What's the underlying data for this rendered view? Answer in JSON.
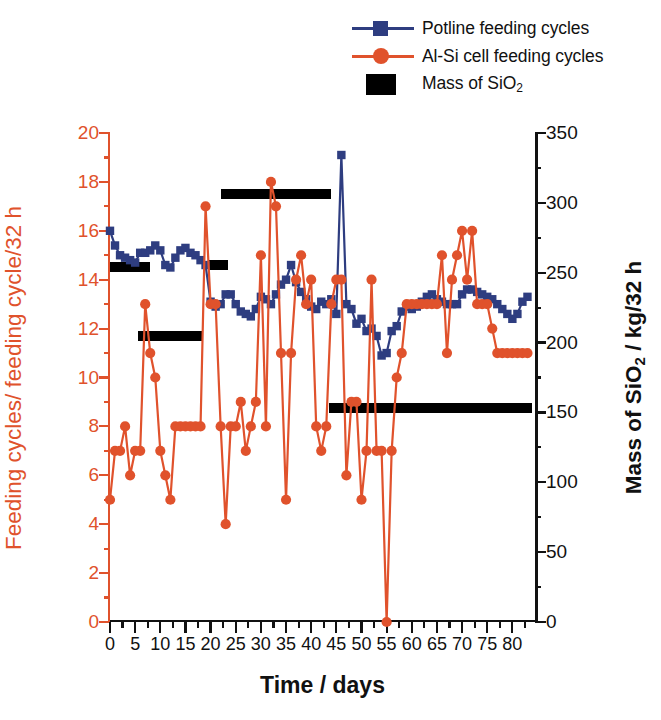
{
  "legend": {
    "items": [
      {
        "label": "Potline feeding cycles",
        "marker": "square-marker-icon",
        "color": "#2e3d80"
      },
      {
        "label": "Al-Si cell feeding cycles",
        "marker": "circle-marker-icon",
        "color": "#e0522c"
      },
      {
        "label": "Mass of SiO",
        "sub": "2",
        "label_suffix": "",
        "marker": "black-bar-icon",
        "color": "#000000"
      }
    ],
    "mass_label_prefix": "Mass of SiO"
  },
  "chart_data": {
    "type": "line",
    "title": "",
    "xlabel": "Time / days",
    "ylabel_left": "Feeding cycles/ feeding cycle/32 h",
    "ylabel_right_prefix": "Mass of SiO",
    "ylabel_right_sub": "2",
    "ylabel_right_suffix": " / kg/32 h",
    "xlim": [
      0,
      84.5
    ],
    "ylim_left": [
      0,
      20
    ],
    "ylim_right": [
      0,
      350
    ],
    "xticks": [
      0,
      5,
      10,
      15,
      20,
      25,
      30,
      35,
      40,
      45,
      50,
      55,
      60,
      65,
      70,
      75,
      80
    ],
    "xminor_step": 2.5,
    "yticks_left": [
      0,
      2,
      4,
      6,
      8,
      10,
      12,
      14,
      16,
      18,
      20
    ],
    "yminor_left_step": 1,
    "yticks_right": [
      0,
      50,
      100,
      150,
      200,
      250,
      300,
      350
    ],
    "yminor_right_step": 25,
    "grid": false,
    "legend_position": "top-right",
    "series": [
      {
        "name": "Potline feeding cycles",
        "axis": "left",
        "color": "#2e3d80",
        "marker": "square",
        "x": [
          0,
          1,
          2,
          3,
          4,
          5,
          6,
          7,
          8,
          9,
          10,
          11,
          12,
          13,
          14,
          15,
          16,
          17,
          18,
          19,
          20,
          21,
          22,
          23,
          24,
          25,
          26,
          27,
          28,
          29,
          30,
          31,
          32,
          33,
          34,
          35,
          36,
          37,
          38,
          39,
          40,
          41,
          42,
          43,
          44,
          45,
          46,
          47,
          48,
          49,
          50,
          51,
          52,
          53,
          54,
          55,
          56,
          57,
          58,
          59,
          60,
          61,
          62,
          63,
          64,
          65,
          66,
          67,
          68,
          69,
          70,
          71,
          72,
          73,
          74,
          75,
          76,
          77,
          78,
          79,
          80,
          81,
          82,
          83
        ],
        "y": [
          16.0,
          15.4,
          15.0,
          14.9,
          14.8,
          14.7,
          15.1,
          15.1,
          15.2,
          15.4,
          15.2,
          14.6,
          14.5,
          14.9,
          15.2,
          15.3,
          15.1,
          15.0,
          14.8,
          14.6,
          13.1,
          12.9,
          13.0,
          13.4,
          13.4,
          13.0,
          12.7,
          12.6,
          12.5,
          12.8,
          13.3,
          13.2,
          13.0,
          13.4,
          13.8,
          14.0,
          14.6,
          13.9,
          13.5,
          13.2,
          12.9,
          12.8,
          13.1,
          13.0,
          13.2,
          12.6,
          19.1,
          13.0,
          12.8,
          12.2,
          12.4,
          11.9,
          12.0,
          11.7,
          10.9,
          11.0,
          11.9,
          12.1,
          12.7,
          12.9,
          12.8,
          12.9,
          13.1,
          13.3,
          13.4,
          13.2,
          13.1,
          13.0,
          13.0,
          13.0,
          13.4,
          13.6,
          13.6,
          13.5,
          13.4,
          13.3,
          13.2,
          13.0,
          12.8,
          12.6,
          12.4,
          12.6,
          13.1,
          13.3
        ]
      },
      {
        "name": "Al-Si cell feeding cycles",
        "axis": "left",
        "color": "#e0522c",
        "marker": "circle",
        "x": [
          0,
          1,
          2,
          3,
          4,
          5,
          6,
          7,
          8,
          9,
          10,
          11,
          12,
          13,
          14,
          15,
          16,
          17,
          18,
          19,
          20,
          21,
          22,
          23,
          24,
          25,
          26,
          27,
          28,
          29,
          30,
          31,
          32,
          33,
          34,
          35,
          36,
          37,
          38,
          39,
          40,
          41,
          42,
          43,
          44,
          45,
          46,
          47,
          48,
          49,
          50,
          51,
          52,
          53,
          54,
          55,
          56,
          57,
          58,
          59,
          60,
          61,
          62,
          63,
          64,
          65,
          66,
          67,
          68,
          69,
          70,
          71,
          72,
          73,
          74,
          75,
          76,
          77,
          78,
          79,
          80,
          81,
          82,
          83
        ],
        "y": [
          5,
          7,
          7,
          8,
          6,
          7,
          7,
          13,
          11,
          10,
          7,
          6,
          5,
          8,
          8,
          8,
          8,
          8,
          8,
          17,
          13,
          13,
          8,
          4,
          8,
          8,
          9,
          7,
          8,
          9,
          15,
          8,
          18,
          17,
          11,
          5,
          11,
          14,
          15,
          13,
          14,
          8,
          7,
          8,
          13,
          14,
          14,
          6,
          9,
          9,
          5,
          7,
          14,
          7,
          7,
          0,
          7,
          10,
          11,
          13,
          13,
          13,
          13,
          13,
          13,
          13,
          15,
          11,
          14,
          15,
          16,
          14,
          16,
          13,
          13,
          13,
          12,
          11,
          11,
          11,
          11,
          11,
          11,
          11
        ]
      }
    ],
    "bars": [
      {
        "name": "bar-1",
        "x_start": 0.0,
        "x_end": 8.0,
        "value_left": 14.5,
        "value_right": 254
      },
      {
        "name": "bar-2",
        "x_start": 5.5,
        "x_end": 18.5,
        "value_left": 11.7,
        "value_right": 205
      },
      {
        "name": "bar-3",
        "x_start": 19.5,
        "x_end": 23.5,
        "value_left": 14.6,
        "value_right": 256
      },
      {
        "name": "bar-4",
        "x_start": 22.0,
        "x_end": 44.0,
        "value_left": 17.5,
        "value_right": 306
      },
      {
        "name": "bar-5",
        "x_start": 43.5,
        "x_end": 84.0,
        "value_left": 8.75,
        "value_right": 153
      }
    ]
  }
}
